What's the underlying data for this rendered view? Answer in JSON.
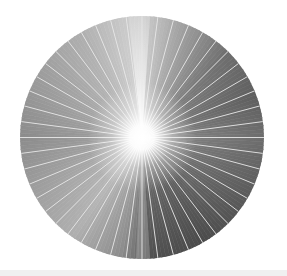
{
  "image": {
    "subject": "radial light burst in a circle",
    "ray_count": 48,
    "colors": {
      "background": "#ffffff",
      "ray_line": "#e6e6e6",
      "center_glow": "#ffffff",
      "light_gray": "#bdbdbd",
      "mid_gray": "#8e8e8e",
      "dark_gray": "#4a4a4a",
      "bottom_strip": "#f0f0f0"
    }
  }
}
